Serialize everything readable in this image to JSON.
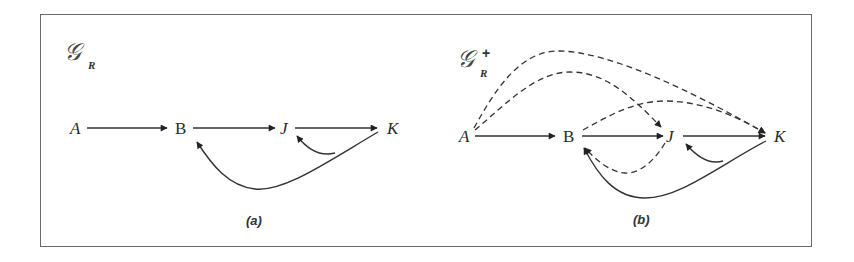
{
  "figure": {
    "panels": [
      {
        "id": "a",
        "graph_label": "𝒢",
        "graph_subscript": "R",
        "graph_superscript": "",
        "caption": "(a)",
        "nodes": [
          {
            "id": "A",
            "label": "A",
            "italic": true
          },
          {
            "id": "B",
            "label": "B",
            "italic": false
          },
          {
            "id": "J",
            "label": "J",
            "italic": true
          },
          {
            "id": "K",
            "label": "K",
            "italic": true
          }
        ],
        "edges": [
          {
            "from": "A",
            "to": "B",
            "style": "solid"
          },
          {
            "from": "B",
            "to": "J",
            "style": "solid"
          },
          {
            "from": "J",
            "to": "K",
            "style": "solid"
          },
          {
            "from": "K",
            "to": "B",
            "style": "solid",
            "curved": true
          },
          {
            "from": "K",
            "to": "J",
            "style": "solid",
            "curved": true
          }
        ]
      },
      {
        "id": "b",
        "graph_label": "𝒢",
        "graph_subscript": "R",
        "graph_superscript": "+",
        "caption": "(b)",
        "nodes": [
          {
            "id": "A",
            "label": "A",
            "italic": true
          },
          {
            "id": "B",
            "label": "B",
            "italic": false
          },
          {
            "id": "J",
            "label": "J",
            "italic": true
          },
          {
            "id": "K",
            "label": "K",
            "italic": true
          }
        ],
        "edges": [
          {
            "from": "A",
            "to": "B",
            "style": "solid"
          },
          {
            "from": "B",
            "to": "J",
            "style": "solid"
          },
          {
            "from": "J",
            "to": "K",
            "style": "solid"
          },
          {
            "from": "K",
            "to": "B",
            "style": "solid",
            "curved": true
          },
          {
            "from": "K",
            "to": "J",
            "style": "solid",
            "curved": true
          },
          {
            "from": "A",
            "to": "K",
            "style": "dashed",
            "curved": true
          },
          {
            "from": "A",
            "to": "J",
            "style": "dashed",
            "curved": true
          },
          {
            "from": "B",
            "to": "K",
            "style": "dashed",
            "curved": true
          },
          {
            "from": "J",
            "to": "B",
            "style": "dashed",
            "curved": true
          }
        ]
      }
    ]
  }
}
